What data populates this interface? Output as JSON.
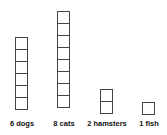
{
  "chart_data": {
    "type": "bar",
    "title": "",
    "xlabel": "",
    "ylabel": "",
    "categories": [
      "dogs",
      "cats",
      "hamsters",
      "fish"
    ],
    "values": [
      6,
      8,
      2,
      1
    ],
    "unit_style": "stacked squares (1 square = 1 pet)"
  },
  "labels": {
    "dogs": "6 dogs",
    "cats": "8 cats",
    "hamsters": "2 hamsters",
    "fish": "1 fish"
  }
}
